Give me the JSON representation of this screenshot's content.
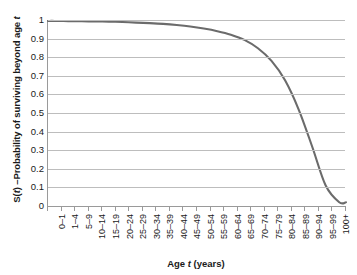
{
  "chart_data": {
    "type": "line",
    "title": "",
    "xlabel": "Age t (years)",
    "ylabel": "S(t) –Probability of surviving beyond age t",
    "ylim": [
      0,
      1
    ],
    "ytick_values": [
      0,
      0.1,
      0.2,
      0.3,
      0.4,
      0.5,
      0.6,
      0.7,
      0.8,
      0.9,
      1
    ],
    "ytick_labels": [
      "0",
      "0.1",
      "0.2",
      "0.3",
      "0.4",
      "0.5",
      "0.6",
      "0.7",
      "0.8",
      "0.9",
      "1"
    ],
    "grid": true,
    "legend": false,
    "line_color": "#6b6b6b",
    "gridline_color": "#bdbdbd",
    "axis_color": "#9a9a9a",
    "background": "#ffffff",
    "categories": [
      "0–1",
      "1–4",
      "5–9",
      "10–14",
      "15–19",
      "20–24",
      "25–29",
      "30–34",
      "35–39",
      "40–44",
      "45–49",
      "50–54",
      "55–59",
      "60–64",
      "65–69",
      "70–74",
      "75–79",
      "80–84",
      "85–89",
      "90–94",
      "95–99",
      "100+"
    ],
    "values": [
      0.995,
      0.994,
      0.993,
      0.992,
      0.991,
      0.989,
      0.986,
      0.983,
      0.979,
      0.973,
      0.965,
      0.954,
      0.94,
      0.921,
      0.893,
      0.848,
      0.78,
      0.676,
      0.52,
      0.32,
      0.11,
      0.02
    ],
    "series_name": "Survival function S(t)"
  }
}
